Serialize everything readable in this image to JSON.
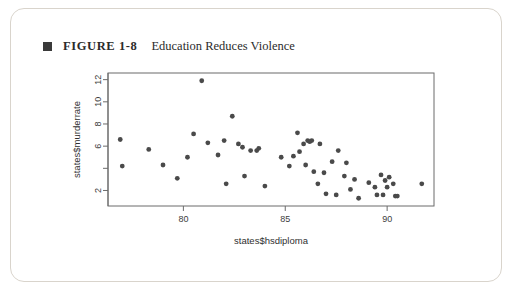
{
  "caption": {
    "marker": "square-bullet",
    "figure_number": "FIGURE 1-8",
    "title": "Education Reduces Violence"
  },
  "chart_data": {
    "type": "scatter",
    "title": "",
    "xlabel": "states$hsdiploma",
    "ylabel": "states$murderrate",
    "xlim": [
      76.3,
      92.3
    ],
    "ylim": [
      0.6,
      12.6
    ],
    "xticks": [
      80,
      85,
      90
    ],
    "xticklabels": [
      "80",
      "85",
      "90"
    ],
    "yticks": [
      2,
      4,
      6,
      8,
      10,
      12
    ],
    "yticklabels": [
      "2",
      "",
      "6",
      "8",
      "10",
      "12"
    ],
    "grid": false,
    "legend": null,
    "marker_color": "#4a4a4a",
    "frame_color": "#6b6b6b",
    "points": [
      {
        "x": 76.9,
        "y": 6.6
      },
      {
        "x": 77.0,
        "y": 4.2
      },
      {
        "x": 78.3,
        "y": 5.7
      },
      {
        "x": 79.0,
        "y": 4.3
      },
      {
        "x": 79.7,
        "y": 3.1
      },
      {
        "x": 80.2,
        "y": 5.0
      },
      {
        "x": 80.5,
        "y": 7.1
      },
      {
        "x": 80.9,
        "y": 11.9
      },
      {
        "x": 81.2,
        "y": 6.3
      },
      {
        "x": 81.7,
        "y": 5.2
      },
      {
        "x": 82.0,
        "y": 6.5
      },
      {
        "x": 82.1,
        "y": 2.6
      },
      {
        "x": 82.4,
        "y": 8.7
      },
      {
        "x": 82.7,
        "y": 6.2
      },
      {
        "x": 82.9,
        "y": 5.9
      },
      {
        "x": 83.0,
        "y": 3.3
      },
      {
        "x": 83.3,
        "y": 5.6
      },
      {
        "x": 83.6,
        "y": 5.6
      },
      {
        "x": 83.7,
        "y": 5.8
      },
      {
        "x": 84.0,
        "y": 2.4
      },
      {
        "x": 84.8,
        "y": 5.0
      },
      {
        "x": 85.2,
        "y": 4.2
      },
      {
        "x": 85.4,
        "y": 5.1
      },
      {
        "x": 85.6,
        "y": 7.2
      },
      {
        "x": 85.7,
        "y": 5.5
      },
      {
        "x": 85.9,
        "y": 6.2
      },
      {
        "x": 86.0,
        "y": 4.3
      },
      {
        "x": 86.1,
        "y": 6.5
      },
      {
        "x": 86.2,
        "y": 6.4
      },
      {
        "x": 86.3,
        "y": 6.5
      },
      {
        "x": 86.4,
        "y": 3.7
      },
      {
        "x": 86.6,
        "y": 2.6
      },
      {
        "x": 86.7,
        "y": 6.2
      },
      {
        "x": 86.9,
        "y": 3.6
      },
      {
        "x": 87.0,
        "y": 1.7
      },
      {
        "x": 87.3,
        "y": 4.6
      },
      {
        "x": 87.5,
        "y": 1.6
      },
      {
        "x": 87.6,
        "y": 5.6
      },
      {
        "x": 87.9,
        "y": 3.3
      },
      {
        "x": 88.0,
        "y": 4.5
      },
      {
        "x": 88.2,
        "y": 2.1
      },
      {
        "x": 88.4,
        "y": 3.0
      },
      {
        "x": 88.6,
        "y": 1.3
      },
      {
        "x": 89.1,
        "y": 2.7
      },
      {
        "x": 89.4,
        "y": 2.3
      },
      {
        "x": 89.5,
        "y": 1.6
      },
      {
        "x": 89.7,
        "y": 3.4
      },
      {
        "x": 89.8,
        "y": 1.6
      },
      {
        "x": 89.9,
        "y": 2.9
      },
      {
        "x": 90.0,
        "y": 2.3
      },
      {
        "x": 90.1,
        "y": 3.2
      },
      {
        "x": 90.3,
        "y": 2.6
      },
      {
        "x": 90.4,
        "y": 1.5
      },
      {
        "x": 90.5,
        "y": 1.5
      },
      {
        "x": 91.7,
        "y": 2.6
      }
    ]
  }
}
